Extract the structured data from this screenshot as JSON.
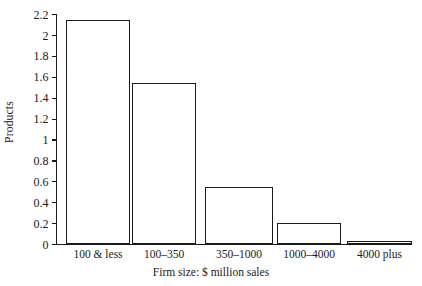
{
  "chart_data": {
    "type": "bar",
    "title": "",
    "xlabel": "Firm size: $ million sales",
    "ylabel": "Products",
    "categories": [
      "100 & less",
      "100–350",
      "350–1000",
      "1000–4000",
      "4000 plus"
    ],
    "values": [
      2.14,
      1.54,
      0.545,
      0.205,
      0.025
    ],
    "ylim": [
      0,
      2.2
    ],
    "xlim_note": "categorical",
    "ytick_labels": [
      "0",
      "0.2",
      "0.4",
      "0.6",
      "0.8",
      "1",
      "1.2",
      "1.4",
      "1.6",
      "1.8",
      "2",
      "2.2"
    ],
    "ytick_values": [
      0,
      0.2,
      0.4,
      0.6,
      0.8,
      1.0,
      1.2,
      1.4,
      1.6,
      1.8,
      2.0,
      2.2
    ],
    "grid": false,
    "legend": null,
    "legend_position": "none",
    "series": [
      {
        "name": "Products",
        "values": [
          2.14,
          1.54,
          0.545,
          0.205,
          0.025
        ]
      }
    ],
    "colors": {
      "bar_fill": "#ffffff",
      "bar_edge": "#1a1a1a",
      "axis": "#1a1a1a",
      "text": "#1a1a1a",
      "background": "#ffffff"
    }
  }
}
